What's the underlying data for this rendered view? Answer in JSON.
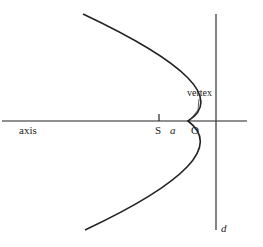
{
  "diagram": {
    "labels": {
      "axis": "axis",
      "focus": "S",
      "distance": "a",
      "origin": "O",
      "vertex": "vertex",
      "directrix": "d"
    },
    "colors": {
      "stroke": "#222222",
      "background": "#ffffff"
    },
    "geometry": {
      "axis_y": 121,
      "axis_x_range": [
        2,
        247
      ],
      "vertex": [
        188,
        121
      ],
      "focus_x": 159,
      "directrix_x": 216,
      "directrix_y_range": [
        14,
        230
      ],
      "curve_top": [
        83,
        14
      ],
      "curve_bottom": [
        85,
        230
      ]
    }
  }
}
